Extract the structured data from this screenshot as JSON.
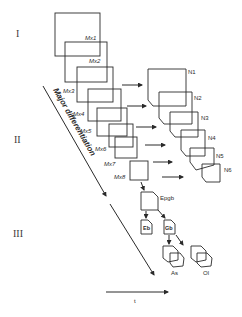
{
  "stages": [
    "I",
    "II",
    "III"
  ],
  "mx_labels": [
    "Mx1",
    "Mx2",
    "Mx3",
    "Mx4",
    "Mx5",
    "Mx6",
    "Mx7",
    "Mx8"
  ],
  "n_labels": [
    "N1",
    "N2",
    "N3",
    "N4",
    "N5",
    "N6"
  ],
  "lineage": {
    "root": "Epgb",
    "children": [
      "Eb",
      "Gb"
    ],
    "grandchildren": [
      "As",
      "Ol"
    ]
  },
  "diagonal_label": "Major differentiation",
  "time_label": "t"
}
